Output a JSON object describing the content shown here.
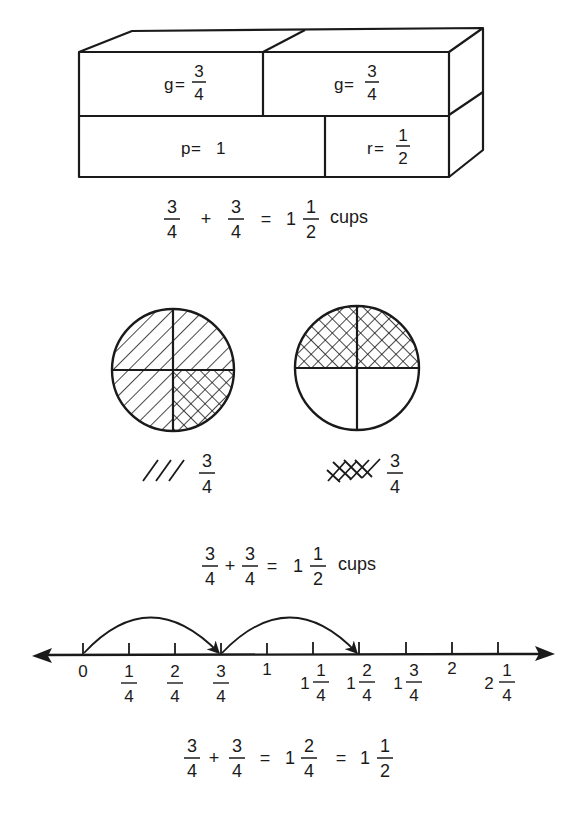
{
  "box_model": {
    "cells": [
      {
        "var": "g",
        "eq": " = ",
        "num": "3",
        "den": "4"
      },
      {
        "var": "g",
        "eq": " = ",
        "num": "3",
        "den": "4"
      },
      {
        "var": "p",
        "eq": " = ",
        "whole": "1"
      },
      {
        "var": "r",
        "eq": " = ",
        "num": "1",
        "den": "2"
      }
    ],
    "equation": {
      "a_num": "3",
      "a_den": "4",
      "plus": "+",
      "b_num": "3",
      "b_den": "4",
      "equals": "=",
      "whole": "1",
      "r_num": "1",
      "r_den": "2",
      "unit": "cups"
    }
  },
  "circle_model": {
    "legend": [
      {
        "pattern": "diagonal-hatch",
        "num": "3",
        "den": "4"
      },
      {
        "pattern": "cross-hatch",
        "num": "3",
        "den": "4"
      }
    ],
    "equation": {
      "a_num": "3",
      "a_den": "4",
      "plus": "+",
      "b_num": "3",
      "b_den": "4",
      "equals": "=",
      "whole": "1",
      "r_num": "1",
      "r_den": "2",
      "unit": "cups"
    }
  },
  "number_line": {
    "ticks": [
      {
        "whole": "0"
      },
      {
        "num": "1",
        "den": "4"
      },
      {
        "num": "2",
        "den": "4"
      },
      {
        "num": "3",
        "den": "4"
      },
      {
        "whole": "1"
      },
      {
        "whole": "1",
        "num": "1",
        "den": "4"
      },
      {
        "whole": "1",
        "num": "2",
        "den": "4"
      },
      {
        "whole": "1",
        "num": "3",
        "den": "4"
      },
      {
        "whole": "2"
      },
      {
        "whole": "2",
        "num": "1",
        "den": "4"
      }
    ],
    "equation": {
      "a_num": "3",
      "a_den": "4",
      "plus": "+",
      "b_num": "3",
      "b_den": "4",
      "eq1": "=",
      "m_whole": "1",
      "m_num": "2",
      "m_den": "4",
      "eq2": "=",
      "r_whole": "1",
      "r_num": "1",
      "r_den": "2"
    }
  }
}
